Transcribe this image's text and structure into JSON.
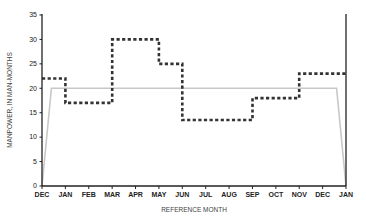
{
  "chart_data": {
    "type": "line",
    "title": "",
    "xlabel": "REFERENCE MONTH",
    "ylabel": "MANPOWER, IN MAN-MONTHS",
    "ylim": [
      0,
      35
    ],
    "y_ticks": [
      0,
      5,
      10,
      15,
      20,
      25,
      30,
      35
    ],
    "categories": [
      "DEC",
      "JAN",
      "FEB",
      "MAR",
      "APR",
      "MAY",
      "JUN",
      "JUL",
      "AUG",
      "SEP",
      "OCT",
      "NOV",
      "DEC",
      "JAN"
    ],
    "grid": false,
    "legend": null,
    "series": [
      {
        "name": "dashed step series",
        "style": "dashed-step",
        "color": "#333333",
        "points": [
          {
            "x": 0,
            "y": 22
          },
          {
            "x": 1,
            "y": 22
          },
          {
            "x": 1,
            "y": 17
          },
          {
            "x": 3,
            "y": 17
          },
          {
            "x": 3,
            "y": 30
          },
          {
            "x": 5,
            "y": 30
          },
          {
            "x": 5,
            "y": 25
          },
          {
            "x": 6,
            "y": 25
          },
          {
            "x": 6,
            "y": 13.5
          },
          {
            "x": 9,
            "y": 13.5
          },
          {
            "x": 9,
            "y": 18
          },
          {
            "x": 11,
            "y": 18
          },
          {
            "x": 11,
            "y": 23
          },
          {
            "x": 13,
            "y": 23
          }
        ]
      },
      {
        "name": "solid gray series",
        "style": "solid",
        "color": "#c8c8c8",
        "points": [
          {
            "x": 0,
            "y": 0
          },
          {
            "x": 0.4,
            "y": 20
          },
          {
            "x": 12.6,
            "y": 20
          },
          {
            "x": 13,
            "y": 0
          }
        ]
      }
    ]
  }
}
